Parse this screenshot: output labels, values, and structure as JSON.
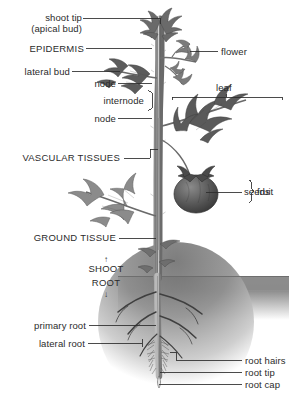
{
  "figure": {
    "width": 289,
    "height": 407,
    "background_color": "#ffffff",
    "ink_color": "#2b2b2b",
    "soil_color": "#8d8d8d",
    "plant_color": "#6f6f6f"
  },
  "labels": {
    "shoot_tip": "shoot tip",
    "apical_bud": "(apical bud)",
    "epidermis": "EPIDERMIS",
    "lateral_bud": "lateral bud",
    "node_upper": "node",
    "internode": "internode",
    "node_lower": "node",
    "flower": "flower",
    "leaf": "leaf",
    "vascular_tissues": "VASCULAR TISSUES",
    "seeds": "seeds",
    "fruit": "fruit",
    "ground_tissue": "GROUND TISSUE",
    "shoot": "SHOOT",
    "root": "ROOT",
    "primary_root": "primary root",
    "lateral_root": "lateral root",
    "root_hairs": "root hairs",
    "root_tip": "root tip",
    "root_cap": "root cap"
  },
  "glyphs": {
    "arrow_up": "↑",
    "arrow_down": "↓"
  }
}
